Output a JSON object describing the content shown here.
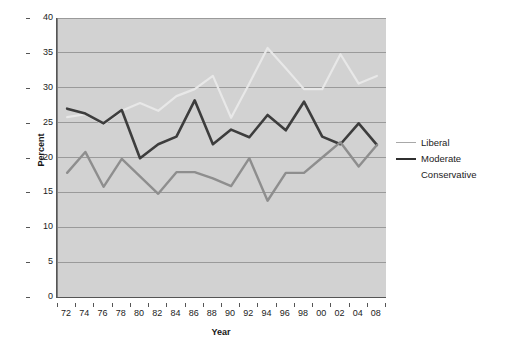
{
  "chart_data": {
    "type": "line",
    "title": "",
    "xlabel": "Year",
    "ylabel": "Percent",
    "ylim": [
      0,
      40
    ],
    "ytick_step": 5,
    "yticks": [
      40,
      35,
      30,
      25,
      20,
      15,
      10,
      5,
      0
    ],
    "grid": true,
    "grid_axis": "y",
    "legend_position": "right",
    "categories": [
      "72",
      "74",
      "76",
      "78",
      "80",
      "82",
      "84",
      "86",
      "88",
      "90",
      "92",
      "94",
      "96",
      "98",
      "00",
      "02",
      "04",
      "08"
    ],
    "series": [
      {
        "name": "Liberal",
        "color": "#e8e8e8",
        "width": 2.2,
        "values": [
          25.8,
          26.2,
          24.8,
          26.7,
          27.8,
          26.7,
          28.8,
          29.8,
          31.7,
          25.7,
          30.6,
          35.7,
          32.8,
          29.8,
          29.8,
          34.8,
          30.6,
          31.7
        ]
      },
      {
        "name": "Moderate",
        "color": "#3d3d3d",
        "width": 2.6,
        "values": [
          27.0,
          26.3,
          24.9,
          26.8,
          19.9,
          21.9,
          23.0,
          28.2,
          21.9,
          24.0,
          22.9,
          26.1,
          23.9,
          28.0,
          23.0,
          21.9,
          24.9,
          21.8
        ]
      },
      {
        "name": "Conservative",
        "color": "#8e8e8e",
        "width": 2.4,
        "values": [
          17.8,
          20.8,
          15.8,
          19.8,
          17.3,
          14.8,
          17.9,
          17.9,
          17.0,
          15.9,
          19.9,
          13.8,
          17.8,
          17.8,
          20.0,
          22.2,
          18.7,
          21.8
        ]
      }
    ]
  },
  "legend": {
    "entries": [
      {
        "label": "Liberal",
        "color": "#a8a8a8",
        "thickness": "1.2px"
      },
      {
        "label": "Moderate",
        "color": "#2f2f2f",
        "thickness": "2.2px"
      },
      {
        "label": "Conservative",
        "color": "#ffffff",
        "thickness": "0px"
      }
    ]
  },
  "style": {
    "plot_background": "#d2d2d2",
    "gridline_color": "#9a9a9a",
    "axis_color": "#555555",
    "text_color": "#1c1c1c",
    "page_background": "#ffffff"
  }
}
